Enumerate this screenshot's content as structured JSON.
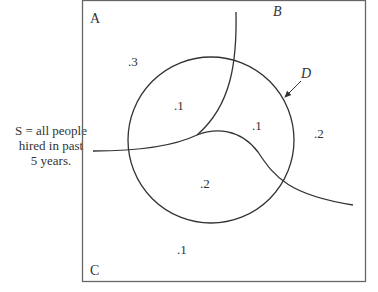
{
  "caption": {
    "line1": "S = all people",
    "line2": "hired in past",
    "line3": "5 years."
  },
  "corner_labels": {
    "A": "A",
    "B": "B",
    "C": "C",
    "D": "D"
  },
  "region_values": {
    "a_outside": ".3",
    "a_inside": ".1",
    "b_inside": ".1",
    "b_outside": ".2",
    "c_inside": ".2",
    "c_outside": ".1"
  },
  "colors": {
    "stroke": "#333333",
    "frame": "#555555",
    "background": "#ffffff"
  }
}
